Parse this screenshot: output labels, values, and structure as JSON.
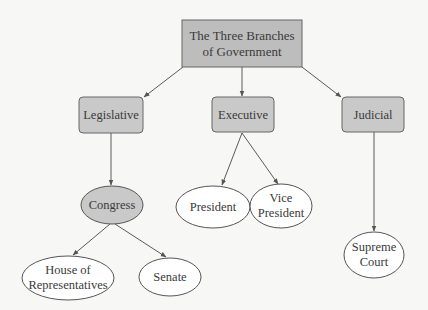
{
  "diagram": {
    "type": "hierarchy-tree",
    "colors": {
      "box_fill": "#c9c9c9",
      "root_fill": "#bdbdbd",
      "ellipse_fill": "#ffffff",
      "highlight_ellipse_fill": "#c9c9c9",
      "stroke": "#555555",
      "text": "#3a3a3a",
      "background": "#f7f7f5"
    },
    "root": {
      "id": "root",
      "lines": [
        "The Three Branches",
        "of Government"
      ]
    },
    "branches": [
      {
        "id": "legislative",
        "label": "Legislative"
      },
      {
        "id": "executive",
        "label": "Executive"
      },
      {
        "id": "judicial",
        "label": "Judicial"
      }
    ],
    "level2": [
      {
        "id": "congress",
        "lines": [
          "Congress"
        ],
        "parent": "legislative",
        "highlight": true
      },
      {
        "id": "president",
        "lines": [
          "President"
        ],
        "parent": "executive"
      },
      {
        "id": "vice-president",
        "lines": [
          "Vice",
          "President"
        ],
        "parent": "executive"
      },
      {
        "id": "supreme-court",
        "lines": [
          "Supreme",
          "Court"
        ],
        "parent": "judicial"
      }
    ],
    "level3": [
      {
        "id": "house",
        "lines": [
          "House of",
          "Representatives"
        ],
        "parent": "congress"
      },
      {
        "id": "senate",
        "lines": [
          "Senate"
        ],
        "parent": "congress"
      }
    ]
  }
}
